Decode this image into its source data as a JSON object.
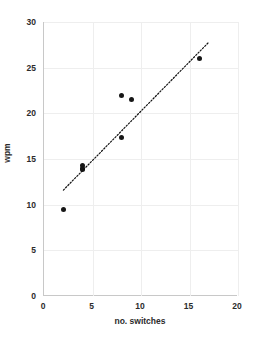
{
  "chart_data": {
    "type": "scatter",
    "title": "",
    "xlabel": "no. switches",
    "ylabel": "wpm",
    "xlim": [
      0,
      20
    ],
    "ylim": [
      0,
      30
    ],
    "xticks": [
      "0",
      "5",
      "10",
      "15",
      "20"
    ],
    "yticks": [
      "0",
      "5",
      "10",
      "15",
      "20",
      "25",
      "30"
    ],
    "grid": true,
    "legend": false,
    "marker_color": "#161616",
    "gridline_color": "#eeeeee",
    "axis_color": "#c8c8c8",
    "points": [
      {
        "x": 2,
        "y": 9.5
      },
      {
        "x": 4,
        "y": 14.3
      },
      {
        "x": 4,
        "y": 14.0
      },
      {
        "x": 4,
        "y": 13.8
      },
      {
        "x": 8,
        "y": 21.9
      },
      {
        "x": 8,
        "y": 17.4
      },
      {
        "x": 9,
        "y": 21.5
      },
      {
        "x": 16,
        "y": 26.0
      }
    ],
    "trendline": {
      "style": "dotted",
      "color": "#111111",
      "x0": 2.0,
      "y0": 11.6,
      "x1": 17.0,
      "y1": 27.8
    }
  }
}
